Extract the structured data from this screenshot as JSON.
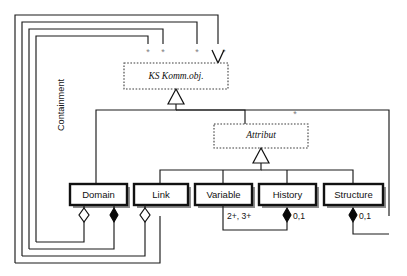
{
  "diagram": {
    "type": "uml-class-diagram",
    "background": "#ffffff",
    "line_color": "#111111",
    "classes": [
      {
        "id": "ks_komm_obj",
        "label": "KS Komm.obj.",
        "style": "abstract",
        "x": 124,
        "y": 63,
        "w": 104,
        "h": 26
      },
      {
        "id": "attribut",
        "label": "Attribut",
        "style": "abstract",
        "x": 214,
        "y": 124,
        "w": 94,
        "h": 24
      },
      {
        "id": "domain",
        "label": "Domain",
        "style": "concrete",
        "x": 70,
        "y": 184,
        "w": 57,
        "h": 21
      },
      {
        "id": "link",
        "label": "Link",
        "style": "concrete",
        "x": 134,
        "y": 184,
        "w": 54,
        "h": 21
      },
      {
        "id": "variable",
        "label": "Variable",
        "style": "concrete",
        "x": 195,
        "y": 184,
        "w": 57,
        "h": 21
      },
      {
        "id": "history",
        "label": "History",
        "style": "concrete",
        "x": 259,
        "y": 184,
        "w": 57,
        "h": 21
      },
      {
        "id": "structure",
        "label": "Structure",
        "style": "concrete",
        "x": 324,
        "y": 184,
        "w": 59,
        "h": 21
      }
    ],
    "containment_label": "Containment",
    "multiplicities": {
      "top_asterisks": [
        "*",
        "*",
        "*",
        "*"
      ],
      "attribut_asterisk": "*",
      "variable_card": "2+, 3+",
      "history_card": "0,1",
      "structure_card": "0,1"
    },
    "relations": [
      {
        "kind": "generalization",
        "from": "attribut",
        "to": "ks_komm_obj",
        "marker": "hollow-triangle"
      },
      {
        "kind": "generalization",
        "from": "domain",
        "to": "ks_komm_obj",
        "marker": "hollow-triangle"
      },
      {
        "kind": "generalization",
        "from": "link",
        "to": "attribut",
        "marker": "hollow-triangle"
      },
      {
        "kind": "generalization",
        "from": "variable",
        "to": "attribut",
        "marker": "hollow-triangle"
      },
      {
        "kind": "generalization",
        "from": "history",
        "to": "attribut",
        "marker": "hollow-triangle"
      },
      {
        "kind": "generalization",
        "from": "structure",
        "to": "attribut",
        "marker": "hollow-triangle"
      },
      {
        "kind": "aggregation",
        "from": "domain",
        "to": "ks_komm_obj",
        "marker": "hollow-diamond",
        "multiplicity": "*"
      },
      {
        "kind": "composition",
        "from": "domain",
        "to": "ks_komm_obj",
        "marker": "filled-diamond",
        "multiplicity": "*"
      },
      {
        "kind": "aggregation",
        "from": "link",
        "to": "ks_komm_obj",
        "marker": "hollow-diamond",
        "multiplicity": "*"
      },
      {
        "kind": "association",
        "from": "variable",
        "to": "history",
        "multiplicity": "2+, 3+"
      },
      {
        "kind": "composition",
        "from": "history",
        "to": "attribut",
        "marker": "filled-diamond",
        "multiplicity": "0,1"
      },
      {
        "kind": "composition",
        "from": "structure",
        "to": "attribut",
        "marker": "filled-diamond",
        "multiplicity": "0,1"
      }
    ]
  }
}
